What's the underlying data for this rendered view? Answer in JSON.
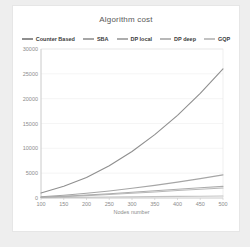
{
  "title": "Algorithm cost",
  "chart_data": {
    "type": "line",
    "title": "Algorithm cost",
    "xlabel": "Nodes number",
    "ylabel": "",
    "x": [
      100,
      150,
      200,
      250,
      300,
      350,
      400,
      450,
      500
    ],
    "xlim": [
      100,
      500
    ],
    "ylim": [
      0,
      30000
    ],
    "yticks": [
      0,
      5000,
      10000,
      15000,
      20000,
      25000,
      30000
    ],
    "grid": true,
    "legend_position": "top",
    "series": [
      {
        "name": "Counter Based",
        "color": "#8f8f8f",
        "values": [
          1000,
          2350,
          4150,
          6500,
          9350,
          12750,
          16650,
          21050,
          26000
        ]
      },
      {
        "name": "SBA",
        "color": "#a6a6a6",
        "values": [
          250,
          550,
          950,
          1400,
          1950,
          2550,
          3200,
          3900,
          4650
        ]
      },
      {
        "name": "DP local",
        "color": "#adadad",
        "values": [
          150,
          350,
          600,
          850,
          1150,
          1450,
          1750,
          2050,
          2350
        ]
      },
      {
        "name": "DP deep",
        "color": "#b8b8b8",
        "values": [
          130,
          280,
          480,
          700,
          950,
          1200,
          1500,
          1750,
          2000
        ]
      },
      {
        "name": "GQP",
        "color": "#c2c2c2",
        "values": [
          60,
          100,
          140,
          190,
          230,
          280,
          320,
          360,
          400
        ]
      }
    ]
  },
  "colors": {
    "page_bg": "#eeeeee",
    "panel_bg": "#ffffff",
    "title_text": "#595959",
    "tick_text": "#8c8c8c",
    "axis_line": "#c9c9c9",
    "grid_line": "#efefef",
    "plot_border": "#e3e3e3"
  }
}
